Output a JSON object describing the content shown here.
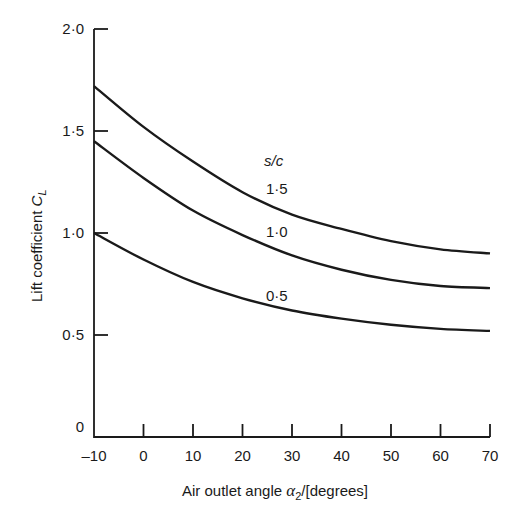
{
  "chart_data": {
    "type": "line",
    "title": "",
    "xlabel": "Air outlet angle α2/[degrees]",
    "ylabel": "Lift coefficient CL",
    "xlim": [
      -10,
      70
    ],
    "ylim": [
      0,
      2.0
    ],
    "grid": false,
    "x_ticks": [
      "-10",
      "0",
      "10",
      "20",
      "30",
      "40",
      "50",
      "60",
      "70"
    ],
    "y_ticks": [
      "0",
      "0·5",
      "1·0",
      "1·5",
      "2·0"
    ],
    "legend_title": "s/c",
    "legend_position": "inline labels above each curve",
    "x": [
      -10,
      0,
      10,
      20,
      30,
      40,
      50,
      60,
      70
    ],
    "series": [
      {
        "name": "1·5",
        "values": [
          1.72,
          1.52,
          1.35,
          1.2,
          1.09,
          1.02,
          0.96,
          0.92,
          0.9
        ]
      },
      {
        "name": "1·0",
        "values": [
          1.45,
          1.27,
          1.11,
          0.99,
          0.89,
          0.82,
          0.77,
          0.74,
          0.73
        ]
      },
      {
        "name": "0·5",
        "values": [
          1.0,
          0.87,
          0.76,
          0.68,
          0.62,
          0.58,
          0.55,
          0.53,
          0.52
        ]
      }
    ]
  },
  "labels": {
    "xlabel_prefix": "Air outlet angle ",
    "xlabel_symbol": "α",
    "xlabel_sub": "2",
    "xlabel_suffix": "/[degrees]",
    "ylabel_prefix": "Lift coefficient ",
    "ylabel_symbol": "C",
    "ylabel_sub": "L",
    "legend_title": "s/c",
    "series_1": "1·5",
    "series_2": "1·0",
    "series_3": "0·5"
  }
}
